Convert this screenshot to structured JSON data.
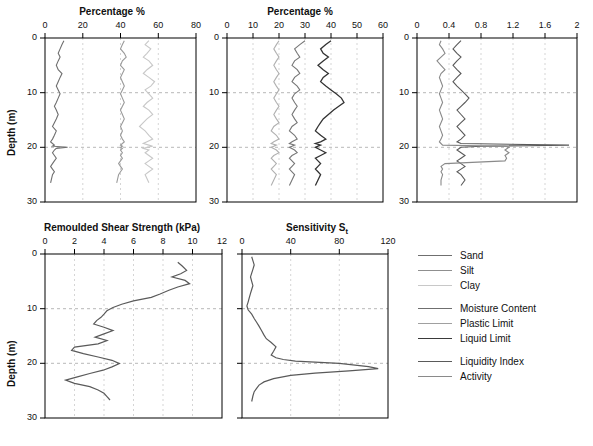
{
  "figure": {
    "ylabel": "Depth (m)",
    "legend": [
      {
        "label": "Sand",
        "color": "#6f6f6f"
      },
      {
        "label": "Silt",
        "color": "#8f8f8f"
      },
      {
        "label": "Clay",
        "color": "#c8c8c8"
      },
      {
        "label": "Moisture Content",
        "color": "#6f6f6f"
      },
      {
        "label": "Plastic Limit",
        "color": "#a0a0a0"
      },
      {
        "label": "Liquid Limit",
        "color": "#3a3a3a"
      },
      {
        "label": "Liquidity Index",
        "color": "#5a5a5a"
      },
      {
        "label": "Activity",
        "color": "#8a8a8a"
      }
    ]
  },
  "chart_data": [
    {
      "type": "line",
      "title": "Percentage %",
      "xlabel": "Percentage %",
      "ylabel": "Depth (m)",
      "xlim": [
        0,
        80
      ],
      "ylim": [
        0,
        30
      ],
      "xticks": [
        0,
        20,
        40,
        60,
        80
      ],
      "yticks": [
        0,
        10,
        20,
        30
      ],
      "grid": true,
      "legend_position": "external-right",
      "series": [
        {
          "name": "Sand",
          "color": "#6f6f6f",
          "x": [
            10,
            9,
            8,
            7,
            8,
            7,
            6,
            7,
            9,
            8,
            7,
            6,
            7,
            8,
            7,
            6,
            5,
            6,
            7,
            6,
            5,
            4,
            6,
            5,
            4,
            3,
            4,
            5,
            4,
            12,
            6,
            5,
            4,
            5,
            6,
            5,
            4,
            3,
            4,
            5,
            4,
            3
          ],
          "y": [
            0.5,
            1.2,
            2.0,
            2.8,
            3.5,
            4.2,
            5.0,
            5.8,
            6.5,
            7.2,
            8.0,
            8.8,
            9.5,
            10.2,
            11.0,
            11.8,
            12.5,
            13.2,
            14.0,
            14.8,
            15.5,
            16.2,
            17.0,
            17.8,
            18.5,
            19.0,
            19.3,
            19.6,
            19.8,
            20.0,
            20.2,
            20.5,
            21.0,
            21.5,
            22.0,
            22.5,
            23.0,
            23.5,
            24.0,
            24.5,
            25.0,
            26.5
          ]
        },
        {
          "name": "Silt",
          "color": "#9a9a9a",
          "x": [
            42,
            41,
            40,
            42,
            43,
            41,
            40,
            42,
            41,
            40,
            41,
            42,
            41,
            40,
            41,
            42,
            41,
            40,
            41,
            42,
            41,
            40,
            41,
            40,
            41,
            42,
            41,
            40,
            41,
            40,
            41,
            40,
            41,
            40,
            41,
            40,
            39,
            40,
            41,
            40,
            39,
            38
          ],
          "y": [
            0.5,
            1.2,
            2.0,
            2.8,
            3.5,
            4.2,
            5.0,
            5.8,
            6.5,
            7.2,
            8.0,
            8.8,
            9.5,
            10.2,
            11.0,
            11.8,
            12.5,
            13.2,
            14.0,
            14.8,
            15.5,
            16.2,
            17.0,
            17.8,
            18.5,
            19.0,
            19.3,
            19.6,
            19.8,
            20.0,
            20.2,
            20.5,
            21.0,
            21.5,
            22.0,
            22.5,
            23.0,
            23.5,
            24.0,
            24.5,
            25.0,
            26.5
          ]
        },
        {
          "name": "Clay",
          "color": "#c8c8c8",
          "x": [
            55,
            53,
            56,
            54,
            52,
            55,
            57,
            54,
            52,
            55,
            58,
            56,
            53,
            55,
            57,
            54,
            52,
            55,
            57,
            54,
            52,
            50,
            53,
            55,
            57,
            54,
            52,
            55,
            57,
            54,
            52,
            55,
            53,
            55,
            57,
            55,
            53,
            55,
            57,
            55,
            53,
            55
          ],
          "y": [
            0.5,
            1.2,
            2.0,
            2.8,
            3.5,
            4.2,
            5.0,
            5.8,
            6.5,
            7.2,
            8.0,
            8.8,
            9.5,
            10.2,
            11.0,
            11.8,
            12.5,
            13.2,
            14.0,
            14.8,
            15.5,
            16.2,
            17.0,
            17.8,
            18.5,
            19.0,
            19.3,
            19.6,
            19.8,
            20.0,
            20.2,
            20.5,
            21.0,
            21.5,
            22.0,
            22.5,
            23.0,
            23.5,
            24.0,
            24.5,
            25.0,
            26.5
          ]
        }
      ]
    },
    {
      "type": "line",
      "title": "Percentage %",
      "xlabel": "Percentage %",
      "ylabel": "Depth (m)",
      "xlim": [
        0,
        60
      ],
      "ylim": [
        0,
        30
      ],
      "xticks": [
        0,
        10,
        20,
        30,
        40,
        50,
        60
      ],
      "yticks": [
        0,
        10,
        20,
        30
      ],
      "grid": true,
      "legend_position": "external-right",
      "series": [
        {
          "name": "Moisture Content",
          "color": "#777777",
          "x": [
            30,
            28,
            26,
            27,
            28,
            26,
            25,
            27,
            28,
            26,
            25,
            27,
            28,
            26,
            25,
            26,
            27,
            26,
            25,
            26,
            27,
            25,
            24,
            26,
            27,
            25,
            24,
            26,
            25,
            24,
            26,
            27,
            25,
            24,
            25,
            26,
            25,
            24,
            25,
            26,
            25,
            24
          ],
          "y": [
            0.5,
            1.2,
            2.0,
            2.8,
            3.5,
            4.2,
            5.0,
            5.8,
            6.5,
            7.2,
            8.0,
            8.8,
            9.5,
            10.2,
            11.0,
            11.8,
            12.5,
            13.2,
            14.0,
            14.8,
            15.5,
            16.2,
            17.0,
            17.8,
            18.5,
            19.0,
            19.3,
            19.6,
            19.8,
            20.0,
            20.5,
            21.0,
            21.5,
            22.0,
            22.5,
            23.0,
            23.5,
            24.0,
            24.5,
            25.0,
            26.0,
            27.0
          ]
        },
        {
          "name": "Plastic Limit",
          "color": "#b0b0b0",
          "x": [
            20,
            19,
            18,
            19,
            20,
            19,
            18,
            19,
            20,
            19,
            18,
            19,
            20,
            19,
            18,
            19,
            20,
            19,
            18,
            19,
            20,
            18,
            17,
            19,
            20,
            18,
            17,
            19,
            18,
            17,
            19,
            20,
            18,
            17,
            18,
            19,
            18,
            17,
            18,
            19,
            18,
            17
          ],
          "y": [
            0.5,
            1.2,
            2.0,
            2.8,
            3.5,
            4.2,
            5.0,
            5.8,
            6.5,
            7.2,
            8.0,
            8.8,
            9.5,
            10.2,
            11.0,
            11.8,
            12.5,
            13.2,
            14.0,
            14.8,
            15.5,
            16.2,
            17.0,
            17.8,
            18.5,
            19.0,
            19.3,
            19.6,
            19.8,
            20.0,
            20.5,
            21.0,
            21.5,
            22.0,
            22.5,
            23.0,
            23.5,
            24.0,
            24.5,
            25.0,
            26.0,
            27.0
          ]
        },
        {
          "name": "Liquid Limit",
          "color": "#333333",
          "x": [
            40,
            38,
            36,
            37,
            39,
            37,
            35,
            37,
            39,
            37,
            36,
            38,
            40,
            42,
            44,
            45,
            43,
            41,
            39,
            37,
            36,
            35,
            34,
            36,
            38,
            36,
            34,
            36,
            35,
            34,
            36,
            38,
            36,
            34,
            35,
            36,
            35,
            34,
            35,
            36,
            35,
            34
          ],
          "y": [
            0.5,
            1.2,
            2.0,
            2.8,
            3.5,
            4.2,
            5.0,
            5.8,
            6.5,
            7.2,
            8.0,
            8.8,
            9.5,
            10.2,
            11.0,
            11.8,
            12.5,
            13.2,
            14.0,
            14.8,
            15.5,
            16.2,
            17.0,
            17.8,
            18.5,
            19.0,
            19.3,
            19.6,
            19.8,
            20.0,
            20.5,
            21.0,
            21.5,
            22.0,
            22.5,
            23.0,
            23.5,
            24.0,
            24.5,
            25.0,
            26.0,
            27.0
          ]
        }
      ]
    },
    {
      "type": "line",
      "title": "",
      "xlabel": "",
      "ylabel": "Depth (m)",
      "xlim": [
        0,
        2
      ],
      "ylim": [
        0,
        30
      ],
      "xticks": [
        0,
        0.4,
        0.8,
        1.2,
        1.6,
        2
      ],
      "yticks": [
        0,
        10,
        20,
        30
      ],
      "grid": true,
      "legend_position": "external-right",
      "series": [
        {
          "name": "Liquidity Index",
          "color": "#5a5a5a",
          "x": [
            0.55,
            0.5,
            0.45,
            0.5,
            0.55,
            0.5,
            0.45,
            0.5,
            0.55,
            0.5,
            0.45,
            0.5,
            0.55,
            0.6,
            0.65,
            0.6,
            0.55,
            0.5,
            0.55,
            0.6,
            0.55,
            0.5,
            0.55,
            0.6,
            0.55,
            0.5,
            0.55,
            1.9,
            0.8,
            0.55,
            0.5,
            0.55,
            0.6,
            0.55,
            0.5,
            0.55,
            0.6,
            0.55,
            0.5,
            0.55,
            0.6,
            0.55
          ],
          "y": [
            0.5,
            1.2,
            2.0,
            2.8,
            3.5,
            4.2,
            5.0,
            5.8,
            6.5,
            7.2,
            8.0,
            8.8,
            9.5,
            10.2,
            11.0,
            11.8,
            12.5,
            13.2,
            14.0,
            14.8,
            15.5,
            16.2,
            17.0,
            17.8,
            18.5,
            19.0,
            19.3,
            19.6,
            19.8,
            20.0,
            20.5,
            21.0,
            21.5,
            22.0,
            22.5,
            23.0,
            23.5,
            24.0,
            24.5,
            25.0,
            26.0,
            27.0
          ]
        },
        {
          "name": "Activity",
          "color": "#8a8a8a",
          "x": [
            0.3,
            0.28,
            0.32,
            0.35,
            0.3,
            0.25,
            0.3,
            0.35,
            0.3,
            0.28,
            0.3,
            0.32,
            0.3,
            0.28,
            0.3,
            0.32,
            0.3,
            0.28,
            0.3,
            0.32,
            0.3,
            0.28,
            0.3,
            0.32,
            0.3,
            0.28,
            0.3,
            0.32,
            1.1,
            1.15,
            1.1,
            1.15,
            1.1,
            1.12,
            1.1,
            0.35,
            0.3,
            0.32,
            0.3,
            0.32,
            0.3,
            0.3
          ],
          "y": [
            0.5,
            1.2,
            2.0,
            2.8,
            3.5,
            4.2,
            5.0,
            5.8,
            6.5,
            7.2,
            8.0,
            8.8,
            9.5,
            10.2,
            11.0,
            11.8,
            12.5,
            13.2,
            14.0,
            14.8,
            15.5,
            16.2,
            17.0,
            17.8,
            18.5,
            19.0,
            19.3,
            19.6,
            19.8,
            20.0,
            20.5,
            21.0,
            21.5,
            22.0,
            22.5,
            23.0,
            23.5,
            24.0,
            24.5,
            25.0,
            26.0,
            27.0
          ]
        }
      ]
    },
    {
      "type": "line",
      "title": "Remoulded Shear Strength (kPa)",
      "xlabel": "Remoulded Shear Strength (kPa)",
      "ylabel": "Depth (m)",
      "xlim": [
        0,
        12
      ],
      "ylim": [
        0,
        30
      ],
      "xticks": [
        0,
        2,
        4,
        6,
        8,
        10,
        12
      ],
      "yticks": [
        0,
        10,
        20,
        30
      ],
      "grid": true,
      "series": [
        {
          "name": "Remoulded Shear Strength",
          "color": "#5a5a5a",
          "x": [
            9.0,
            9.3,
            9.6,
            9.2,
            8.6,
            9.5,
            9.8,
            9.0,
            8.4,
            7.8,
            7.2,
            6.0,
            5.2,
            4.6,
            4.2,
            4.0,
            3.8,
            3.5,
            3.3,
            4.0,
            4.6,
            4.0,
            3.4,
            4.2,
            3.6,
            2.0,
            1.8,
            2.6,
            3.6,
            4.4,
            5.0,
            4.4,
            3.8,
            3.0,
            2.2,
            1.4,
            2.0,
            3.0,
            3.6,
            4.0,
            4.2,
            4.4
          ],
          "y": [
            1.5,
            2.2,
            3.0,
            3.6,
            4.2,
            4.8,
            5.4,
            6.0,
            6.6,
            7.2,
            7.8,
            8.4,
            9.0,
            9.6,
            10.2,
            10.8,
            11.4,
            12.0,
            12.6,
            13.2,
            13.8,
            14.4,
            15.0,
            15.6,
            16.2,
            16.8,
            17.4,
            18.0,
            18.6,
            19.2,
            19.8,
            20.4,
            21.0,
            21.6,
            22.2,
            22.8,
            23.4,
            24.0,
            24.6,
            25.2,
            25.8,
            26.4
          ]
        }
      ]
    },
    {
      "type": "line",
      "title": "Sensitivity St",
      "xlabel": "Sensitivity St",
      "ylabel": "Depth (m)",
      "xlim": [
        0,
        120
      ],
      "ylim": [
        0,
        30
      ],
      "xticks": [
        0,
        40,
        80,
        120
      ],
      "yticks": [
        0,
        10,
        20,
        30
      ],
      "grid": true,
      "series": [
        {
          "name": "Sensitivity",
          "color": "#5a5a5a",
          "x": [
            8,
            9,
            10,
            9,
            8,
            7,
            8,
            9,
            8,
            7,
            6,
            5,
            4,
            5,
            8,
            10,
            12,
            14,
            16,
            18,
            20,
            24,
            28,
            26,
            24,
            28,
            34,
            44,
            60,
            80,
            104,
            112,
            88,
            60,
            40,
            26,
            18,
            14,
            12,
            10,
            9,
            8
          ],
          "y": [
            0.5,
            1.2,
            2.0,
            2.8,
            3.5,
            4.2,
            5.0,
            5.8,
            6.5,
            7.2,
            8.0,
            8.8,
            9.5,
            10.2,
            11.0,
            11.8,
            12.5,
            13.2,
            14.0,
            14.8,
            15.5,
            16.2,
            17.0,
            17.8,
            18.5,
            19.0,
            19.3,
            19.6,
            19.8,
            20.0,
            20.6,
            21.0,
            21.4,
            21.8,
            22.2,
            22.8,
            23.4,
            24.0,
            24.6,
            25.2,
            26.0,
            27.0
          ]
        }
      ]
    }
  ]
}
